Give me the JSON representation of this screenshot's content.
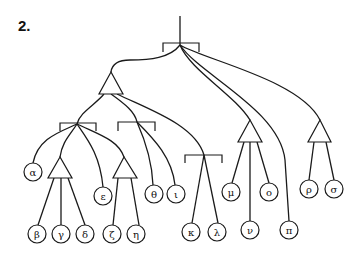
{
  "figure": {
    "number_label": "2.",
    "root": {
      "x": 180,
      "top": 16,
      "y": 45
    },
    "brackets": [
      {
        "id": "root",
        "x1": 163,
        "x2": 199,
        "y": 43,
        "drop": 9,
        "node_x": 180
      },
      {
        "id": "left",
        "x1": 60,
        "x2": 96,
        "y": 123,
        "drop": 8,
        "node_x": 77
      },
      {
        "id": "middle",
        "x1": 118,
        "x2": 155,
        "y": 122,
        "drop": 9,
        "node_x": 137
      },
      {
        "id": "right",
        "x1": 185,
        "x2": 222,
        "y": 155,
        "drop": 8,
        "node_x": 204
      }
    ],
    "triangles": [
      {
        "id": "big",
        "apex": [
          111,
          72
        ],
        "base_y": 94,
        "x1": 99,
        "x2": 123
      },
      {
        "id": "beta-gamma-delta",
        "apex": [
          60,
          157
        ],
        "base_y": 178,
        "x1": 48,
        "x2": 72
      },
      {
        "id": "zeta-eta",
        "apex": [
          124,
          157
        ],
        "base_y": 178,
        "x1": 113,
        "x2": 137
      },
      {
        "id": "mu-nu-omicron",
        "apex": [
          250,
          120
        ],
        "base_y": 142,
        "x1": 238,
        "x2": 262
      },
      {
        "id": "rho-sigma",
        "apex": [
          320,
          120
        ],
        "base_y": 142,
        "x1": 308,
        "x2": 331
      }
    ],
    "leaves": [
      {
        "id": "alpha",
        "label": "α",
        "x": 33,
        "y": 172
      },
      {
        "id": "beta",
        "label": "β",
        "x": 37,
        "y": 234
      },
      {
        "id": "gamma",
        "label": "γ",
        "x": 61,
        "y": 234
      },
      {
        "id": "delta",
        "label": "δ",
        "x": 85,
        "y": 234
      },
      {
        "id": "epsilon",
        "label": "ε",
        "x": 103,
        "y": 196
      },
      {
        "id": "zeta",
        "label": "ζ",
        "x": 112,
        "y": 234
      },
      {
        "id": "eta",
        "label": "η",
        "x": 136,
        "y": 234
      },
      {
        "id": "theta",
        "label": "θ",
        "x": 154,
        "y": 194
      },
      {
        "id": "iota",
        "label": "ι",
        "x": 176,
        "y": 194
      },
      {
        "id": "kappa",
        "label": "κ",
        "x": 191,
        "y": 232
      },
      {
        "id": "lambda",
        "label": "λ",
        "x": 217,
        "y": 232
      },
      {
        "id": "mu",
        "label": "μ",
        "x": 231,
        "y": 192
      },
      {
        "id": "nu",
        "label": "ν",
        "x": 250,
        "y": 230
      },
      {
        "id": "omicron",
        "label": "ο",
        "x": 269,
        "y": 192
      },
      {
        "id": "pi",
        "label": "π",
        "x": 289,
        "y": 230
      },
      {
        "id": "rho",
        "label": "ρ",
        "x": 309,
        "y": 189
      },
      {
        "id": "sigma",
        "label": "σ",
        "x": 334,
        "y": 189
      }
    ],
    "leaf_radius": 9
  }
}
